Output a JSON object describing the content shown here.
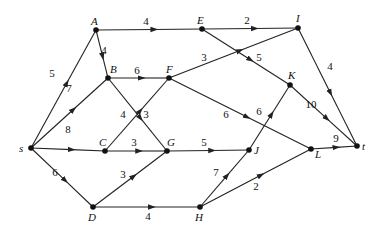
{
  "diagram": {
    "type": "directed-weighted-graph",
    "nodes": [
      {
        "id": "s",
        "label": "s",
        "x": 31,
        "y": 148,
        "lx": 19,
        "ly": 152
      },
      {
        "id": "A",
        "label": "A",
        "x": 96,
        "y": 30,
        "lx": 91,
        "ly": 25
      },
      {
        "id": "B",
        "label": "B",
        "x": 108,
        "y": 78,
        "lx": 110,
        "ly": 73
      },
      {
        "id": "C",
        "label": "C",
        "x": 105,
        "y": 151,
        "lx": 99,
        "ly": 146
      },
      {
        "id": "D",
        "label": "D",
        "x": 93,
        "y": 207,
        "lx": 88,
        "ly": 221
      },
      {
        "id": "E",
        "label": "E",
        "x": 202,
        "y": 29,
        "lx": 197,
        "ly": 24
      },
      {
        "id": "F",
        "label": "F",
        "x": 169,
        "y": 78,
        "lx": 166,
        "ly": 73
      },
      {
        "id": "G",
        "label": "G",
        "x": 167,
        "y": 151,
        "lx": 167,
        "ly": 146
      },
      {
        "id": "H",
        "label": "H",
        "x": 200,
        "y": 207,
        "lx": 195,
        "ly": 221
      },
      {
        "id": "I",
        "label": "I",
        "x": 298,
        "y": 28,
        "lx": 296,
        "ly": 22
      },
      {
        "id": "J",
        "label": "J",
        "x": 249,
        "y": 150,
        "lx": 254,
        "ly": 154
      },
      {
        "id": "K",
        "label": "K",
        "x": 290,
        "y": 85,
        "lx": 288,
        "ly": 79
      },
      {
        "id": "L",
        "label": "L",
        "x": 311,
        "y": 149,
        "lx": 315,
        "ly": 158
      },
      {
        "id": "t",
        "label": "t",
        "x": 357,
        "y": 146,
        "lx": 362,
        "ly": 150
      }
    ],
    "edges": [
      {
        "from": "s",
        "to": "A",
        "weight": "5",
        "lx": 52,
        "ly": 77
      },
      {
        "from": "s",
        "to": "B",
        "weight": "7",
        "lx": 69,
        "ly": 92
      },
      {
        "from": "s",
        "to": "C",
        "weight": "8",
        "lx": 68,
        "ly": 133
      },
      {
        "from": "s",
        "to": "D",
        "weight": "6",
        "lx": 55,
        "ly": 176
      },
      {
        "from": "A",
        "to": "E",
        "weight": "4",
        "lx": 146,
        "ly": 25
      },
      {
        "from": "A",
        "to": "B",
        "weight": "4",
        "lx": 104,
        "ly": 54
      },
      {
        "from": "B",
        "to": "F",
        "weight": "6",
        "lx": 137,
        "ly": 74
      },
      {
        "from": "B",
        "to": "G",
        "weight": "3",
        "lx": 146,
        "ly": 118
      },
      {
        "from": "C",
        "to": "F",
        "weight": "4",
        "lx": 123,
        "ly": 118
      },
      {
        "from": "C",
        "to": "G",
        "weight": "3",
        "lx": 134,
        "ly": 146
      },
      {
        "from": "D",
        "to": "G",
        "weight": "3",
        "lx": 123,
        "ly": 178
      },
      {
        "from": "D",
        "to": "H",
        "weight": "4",
        "lx": 148,
        "ly": 220
      },
      {
        "from": "E",
        "to": "I",
        "weight": "2",
        "lx": 247,
        "ly": 24
      },
      {
        "from": "E",
        "to": "K",
        "weight": "5",
        "lx": 259,
        "ly": 61
      },
      {
        "from": "F",
        "to": "I",
        "weight": "3",
        "lx": 204,
        "ly": 61
      },
      {
        "from": "F",
        "to": "L",
        "weight": "6",
        "lx": 226,
        "ly": 118
      },
      {
        "from": "G",
        "to": "J",
        "weight": "5",
        "lx": 204,
        "ly": 146
      },
      {
        "from": "H",
        "to": "J",
        "weight": "7",
        "lx": 216,
        "ly": 176
      },
      {
        "from": "H",
        "to": "L",
        "weight": "2",
        "lx": 256,
        "ly": 190
      },
      {
        "from": "J",
        "to": "K",
        "weight": "6",
        "lx": 259,
        "ly": 115
      },
      {
        "from": "I",
        "to": "t",
        "weight": "4",
        "lx": 330,
        "ly": 70
      },
      {
        "from": "K",
        "to": "t",
        "weight": "10",
        "lx": 311,
        "ly": 108
      },
      {
        "from": "L",
        "to": "t",
        "weight": "9",
        "lx": 336,
        "ly": 142
      }
    ]
  }
}
